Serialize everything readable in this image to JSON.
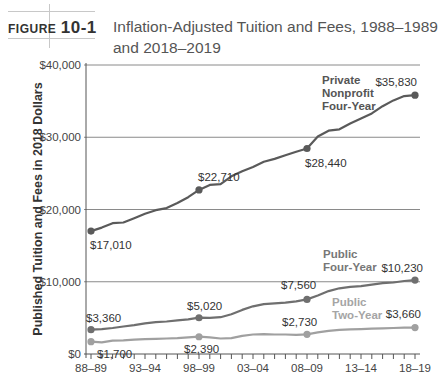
{
  "figure": {
    "label_word": "FIGURE",
    "label_number": "10-1",
    "title": "Inflation-Adjusted Tuition and Fees, 1988–1989 and 2018–2019"
  },
  "chart_data": {
    "type": "line",
    "title": "Inflation-Adjusted Tuition and Fees, 1988–1989 and 2018–2019",
    "xlabel": "",
    "ylabel": "Published Tuition and Fees in 2018 Dollars",
    "ylim": [
      0,
      40000
    ],
    "grid": true,
    "y_ticks": [
      "$0",
      "$10,000",
      "$20,000",
      "$30,000",
      "$40,000"
    ],
    "x_ticks": [
      "88–89",
      "93–94",
      "98–99",
      "03–04",
      "08–09",
      "13–14",
      "18–19"
    ],
    "x": [
      "88–89",
      "89–90",
      "90–91",
      "91–92",
      "92–93",
      "93–94",
      "94–95",
      "95–96",
      "96–97",
      "97–98",
      "98–99",
      "99–00",
      "00–01",
      "01–02",
      "02–03",
      "03–04",
      "04–05",
      "05–06",
      "06–07",
      "07–08",
      "08–09",
      "09–10",
      "10–11",
      "11–12",
      "12–13",
      "13–14",
      "14–15",
      "15–16",
      "16–17",
      "17–18",
      "18–19"
    ],
    "series": [
      {
        "name": "Private Nonprofit Four-Year",
        "color": "#5a5a5a",
        "values": [
          17010,
          17500,
          18100,
          18200,
          18800,
          19400,
          19900,
          20200,
          20900,
          21700,
          22710,
          23400,
          23500,
          24600,
          25300,
          25900,
          26600,
          27000,
          27500,
          28000,
          28440,
          30100,
          30900,
          31100,
          31900,
          32600,
          33300,
          34300,
          35100,
          35700,
          35830
        ],
        "labeled_points": [
          {
            "x": "88–89",
            "label": "$17,010"
          },
          {
            "x": "98–99",
            "label": "$22,710"
          },
          {
            "x": "08–09",
            "label": "$28,440"
          },
          {
            "x": "18–19",
            "label": "$35,830"
          }
        ]
      },
      {
        "name": "Public Four-Year",
        "color": "#6f6f6f",
        "values": [
          3360,
          3450,
          3600,
          3800,
          4000,
          4250,
          4400,
          4500,
          4650,
          4800,
          5020,
          5000,
          5100,
          5500,
          6100,
          6600,
          6900,
          7000,
          7100,
          7300,
          7560,
          8100,
          8700,
          9100,
          9300,
          9400,
          9600,
          9800,
          9900,
          10100,
          10230
        ],
        "labeled_points": [
          {
            "x": "88–89",
            "label": "$3,360"
          },
          {
            "x": "98–99",
            "label": "$5,020"
          },
          {
            "x": "08–09",
            "label": "$7,560"
          },
          {
            "x": "18–19",
            "label": "$10,230"
          }
        ]
      },
      {
        "name": "Public Two-Year",
        "color": "#a0a0a0",
        "values": [
          1700,
          1600,
          1850,
          1900,
          2000,
          2050,
          2100,
          2150,
          2200,
          2300,
          2390,
          2300,
          2150,
          2200,
          2500,
          2700,
          2750,
          2700,
          2700,
          2650,
          2730,
          3000,
          3200,
          3350,
          3400,
          3450,
          3500,
          3550,
          3600,
          3650,
          3660
        ],
        "labeled_points": [
          {
            "x": "88–89",
            "label": "$1,700"
          },
          {
            "x": "98–99",
            "label": "$2,390"
          },
          {
            "x": "08–09",
            "label": "$2,730"
          },
          {
            "x": "18–19",
            "label": "$3,660"
          }
        ]
      }
    ],
    "annotations": [
      {
        "series": "Private Nonprofit Four-Year",
        "lines": [
          "Private",
          "Nonprofit",
          "Four-Year"
        ]
      },
      {
        "series": "Public Four-Year",
        "lines": [
          "Public",
          "Four-Year"
        ]
      },
      {
        "series": "Public Two-Year",
        "lines": [
          "Public",
          "Two-Year"
        ]
      }
    ],
    "legend_position": "inline"
  }
}
